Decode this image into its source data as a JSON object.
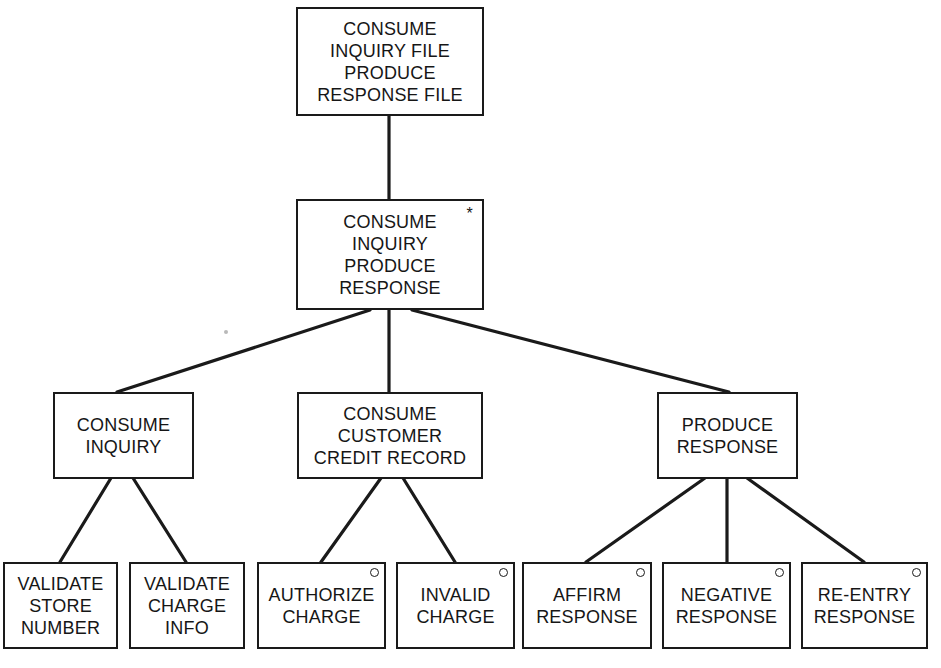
{
  "diagram": {
    "type": "jackson-structure-chart",
    "colors": {
      "line": "#1a1a1a",
      "text": "#161616",
      "background": "#ffffff"
    },
    "nodes": {
      "root": {
        "label": "CONSUME\nINQUIRY FILE\nPRODUCE\nRESPONSE FILE"
      },
      "iteration": {
        "label": "CONSUME\nINQUIRY\nPRODUCE\nRESPONSE",
        "marker": "*"
      },
      "consume_inquiry": {
        "label": "CONSUME\nINQUIRY"
      },
      "consume_credit": {
        "label": "CONSUME\nCUSTOMER\nCREDIT RECORD"
      },
      "produce_response": {
        "label": "PRODUCE\nRESPONSE"
      },
      "validate_store": {
        "label": "VALIDATE\nSTORE\nNUMBER"
      },
      "validate_charge": {
        "label": "VALIDATE\nCHARGE\nINFO"
      },
      "authorize_charge": {
        "label": "AUTHORIZE\nCHARGE",
        "marker": "o"
      },
      "invalid_charge": {
        "label": "INVALID\nCHARGE",
        "marker": "o"
      },
      "affirm_response": {
        "label": "AFFIRM\nRESPONSE",
        "marker": "o"
      },
      "negative_response": {
        "label": "NEGATIVE\nRESPONSE",
        "marker": "o"
      },
      "reentry_response": {
        "label": "RE-ENTRY\nRESPONSE",
        "marker": "o"
      }
    },
    "edges": [
      {
        "from": "root",
        "to": "iteration"
      },
      {
        "from": "iteration",
        "to": "consume_inquiry"
      },
      {
        "from": "iteration",
        "to": "consume_credit"
      },
      {
        "from": "iteration",
        "to": "produce_response"
      },
      {
        "from": "consume_inquiry",
        "to": "validate_store"
      },
      {
        "from": "consume_inquiry",
        "to": "validate_charge"
      },
      {
        "from": "consume_credit",
        "to": "authorize_charge"
      },
      {
        "from": "consume_credit",
        "to": "invalid_charge"
      },
      {
        "from": "produce_response",
        "to": "affirm_response"
      },
      {
        "from": "produce_response",
        "to": "negative_response"
      },
      {
        "from": "produce_response",
        "to": "reentry_response"
      }
    ]
  }
}
